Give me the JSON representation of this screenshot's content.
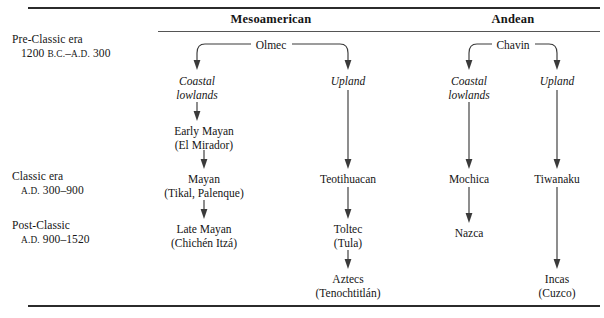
{
  "figure": {
    "eras": [
      {
        "id": "pre-classic",
        "line1": "Pre-Classic era",
        "line2_pre": "1200 ",
        "line2_bc": "B.C.",
        "line2_mid": "–",
        "line2_ad": "A.D.",
        "line2_post": " 300"
      },
      {
        "id": "classic",
        "line1": "Classic era",
        "line2_pre": "",
        "line2_bc": "",
        "line2_mid": "",
        "line2_ad": "A.D.",
        "line2_post": " 300–900"
      },
      {
        "id": "post-classic",
        "line1": "Post-Classic",
        "line2_pre": "",
        "line2_bc": "",
        "line2_mid": "",
        "line2_ad": "A.D.",
        "line2_post": " 900–1520"
      }
    ],
    "groups": [
      {
        "id": "mesoamerican",
        "label": "Mesoamerican"
      },
      {
        "id": "andean",
        "label": "Andean"
      }
    ],
    "roots": [
      {
        "id": "olmec",
        "label": "Olmec",
        "group": "mesoamerican"
      },
      {
        "id": "chavin",
        "label": "Chavin",
        "group": "andean"
      }
    ],
    "branches": [
      {
        "id": "meso-coastal",
        "l1": "Coastal",
        "l2": "lowlands"
      },
      {
        "id": "meso-upland",
        "l1": "Upland",
        "l2": ""
      },
      {
        "id": "andean-coastal",
        "l1": "Coastal",
        "l2": "lowlands"
      },
      {
        "id": "andean-upland",
        "l1": "Upland",
        "l2": ""
      }
    ],
    "nodes": [
      {
        "id": "early-mayan",
        "l1": "Early Mayan",
        "l2": "(El Mirador)"
      },
      {
        "id": "mayan",
        "l1": "Mayan",
        "l2": "(Tikal, Palenque)"
      },
      {
        "id": "late-mayan",
        "l1": "Late Mayan",
        "l2": "(Chichén Itzá)"
      },
      {
        "id": "teotihuacan",
        "l1": "Teotihuacan",
        "l2": ""
      },
      {
        "id": "toltec",
        "l1": "Toltec",
        "l2": "(Tula)"
      },
      {
        "id": "aztecs",
        "l1": "Aztecs",
        "l2": "(Tenochtitlán)"
      },
      {
        "id": "mochica",
        "l1": "Mochica",
        "l2": ""
      },
      {
        "id": "nazca",
        "l1": "Nazca",
        "l2": ""
      },
      {
        "id": "tiwanaku",
        "l1": "Tiwanaku",
        "l2": ""
      },
      {
        "id": "incas",
        "l1": "Incas",
        "l2": "(Cuzco)"
      }
    ]
  }
}
